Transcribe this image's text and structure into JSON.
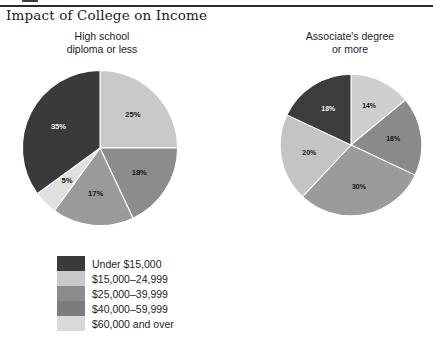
{
  "figure": {
    "title": "Impact of College on Income"
  },
  "palette": {
    "under_15000": "#3a3a3a",
    "from_15000_to_24999": "#c9c9c9",
    "from_25000_to_39999": "#8c8c8c",
    "from_40000_to_59999": "#7c7c7c",
    "over_60000": "#dadada",
    "rule": "#2b2b2b",
    "text": "#1b1b1b"
  },
  "legend": {
    "items": [
      {
        "label": "Under $15,000",
        "color": "#3a3a3a"
      },
      {
        "label": "$15,000–24,999",
        "color": "#c9c9c9"
      },
      {
        "label": "$25,000–39,999",
        "color": "#8c8c8c"
      },
      {
        "label": "$40,000–59,999",
        "color": "#7c7c7c"
      },
      {
        "label": "$60,000 and over",
        "color": "#dadada"
      }
    ]
  },
  "panels": [
    {
      "id": "high-school",
      "heading_line1": "High school",
      "heading_line2": "diploma or less"
    },
    {
      "id": "associates",
      "heading_line1": "Associate's degree",
      "heading_line2": "or more"
    }
  ],
  "chart_data": [
    {
      "type": "pie",
      "title": "High school diploma or less",
      "categories": [
        "$15,000–24,999",
        "$25,000–39,999",
        "$40,000–59,999",
        "$60,000 and over",
        "Under $15,000"
      ],
      "values": [
        25,
        18,
        17,
        5,
        35
      ],
      "labels": [
        "25%",
        "18%",
        "17%",
        "5%",
        "35%"
      ],
      "colors": [
        "#c9c9c9",
        "#8c8c8c",
        "#9a9a9a",
        "#e0e0e0",
        "#3a3a3a"
      ],
      "units": "percent",
      "start_angle_deg": 0,
      "direction": "clockwise",
      "legend_position": "below-left"
    },
    {
      "type": "pie",
      "title": "Associate's degree or more",
      "categories": [
        "$15,000–24,999",
        "$25,000–39,999",
        "$40,000–59,999",
        "$60,000 and over",
        "Under $15,000"
      ],
      "values": [
        14,
        18,
        30,
        20,
        18
      ],
      "labels": [
        "14%",
        "18%",
        "30%",
        "20%",
        "18%"
      ],
      "colors": [
        "#cfcfcf",
        "#8a8a8a",
        "#9b9b9b",
        "#c4c4c4",
        "#3c3c3c"
      ],
      "units": "percent",
      "start_angle_deg": 0,
      "direction": "clockwise",
      "legend_position": "below-left"
    }
  ]
}
